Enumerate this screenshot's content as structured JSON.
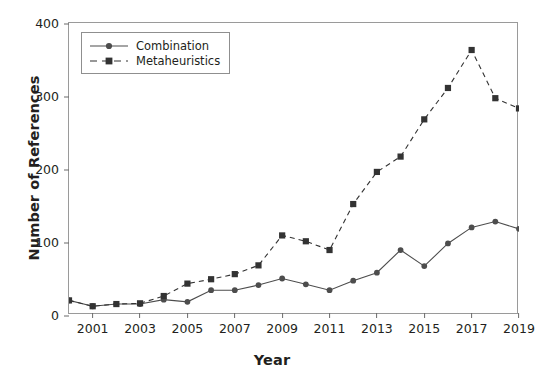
{
  "chart_data": {
    "type": "line",
    "title": "",
    "xlabel": "Year",
    "ylabel": "Number of References",
    "xlim": [
      2000,
      2019
    ],
    "ylim": [
      0,
      400
    ],
    "xticks": [
      2001,
      2003,
      2005,
      2007,
      2009,
      2011,
      2013,
      2015,
      2017,
      2019
    ],
    "yticks": [
      0,
      100,
      200,
      300,
      400
    ],
    "grid": false,
    "legend_position": "upper left",
    "x": [
      2000,
      2001,
      2002,
      2003,
      2004,
      2005,
      2006,
      2007,
      2008,
      2009,
      2010,
      2011,
      2012,
      2013,
      2014,
      2015,
      2016,
      2017,
      2018,
      2019
    ],
    "series": [
      {
        "name": "Combination",
        "marker": "circle",
        "linestyle": "solid",
        "color": "#4d4d4d",
        "values": [
          20,
          12,
          15,
          15,
          21,
          18,
          34,
          34,
          41,
          50,
          42,
          34,
          47,
          58,
          89,
          67,
          98,
          120,
          128,
          118
        ]
      },
      {
        "name": "Metaheuristics",
        "marker": "square",
        "linestyle": "dashed",
        "color": "#333333",
        "values": [
          20,
          12,
          15,
          16,
          26,
          43,
          49,
          56,
          68,
          109,
          101,
          89,
          152,
          196,
          217,
          268,
          311,
          363,
          297,
          283
        ]
      }
    ]
  },
  "legend": {
    "items": [
      {
        "label": "Combination"
      },
      {
        "label": "Metaheuristics"
      }
    ]
  },
  "axes": {
    "y_title": "Number of References",
    "x_title": "Year"
  }
}
